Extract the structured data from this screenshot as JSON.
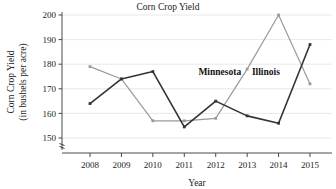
{
  "chart_data": {
    "type": "line",
    "title": "Corn Crop Yield",
    "xlabel": "Year",
    "ylabel_line1": "Corn Crop Yield",
    "ylabel_line2": "(in bushels per acre)",
    "categories": [
      "2008",
      "2009",
      "2010",
      "2011",
      "2012",
      "2013",
      "2014",
      "2015"
    ],
    "x": [
      2008,
      2009,
      2010,
      2011,
      2012,
      2013,
      2014,
      2015
    ],
    "ylim": [
      150,
      200
    ],
    "yticks": [
      150,
      160,
      170,
      180,
      190,
      200
    ],
    "grid": true,
    "y_axis_break": true,
    "legend_position": "inline-annotations",
    "series": [
      {
        "name": "Minnesota",
        "color": "#333333",
        "label_x": 2011.45,
        "label_y": 177.0,
        "values": [
          164,
          174,
          177,
          154.5,
          165,
          159,
          156,
          188
        ]
      },
      {
        "name": "Illinois",
        "color": "#9a9a9a",
        "label_x": 2013.15,
        "label_y": 177.0,
        "values": [
          179,
          174,
          157,
          157,
          158,
          178,
          200,
          172
        ]
      }
    ]
  },
  "colors": {
    "minnesota": "#333333",
    "illinois": "#9a9a9a",
    "grid": "#e2e2e2",
    "axis": "#4a4a4a",
    "background": "#ffffff"
  }
}
